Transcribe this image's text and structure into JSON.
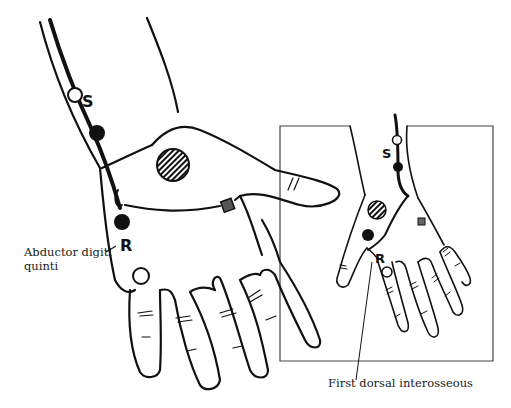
{
  "diagram": {
    "type": "anatomical-illustration",
    "colors": {
      "ink": "#111111",
      "background": "#ffffff",
      "frame": "#444444"
    },
    "main_view": {
      "markers": {
        "stimulation": "S",
        "recording": "R"
      },
      "labels": {
        "muscle_line1": "Abductor digiti",
        "muscle_line2": "quinti"
      }
    },
    "inset_view": {
      "markers": {
        "stimulation": "S",
        "recording": "R"
      },
      "labels": {
        "muscle": "First dorsal interosseous"
      }
    }
  }
}
